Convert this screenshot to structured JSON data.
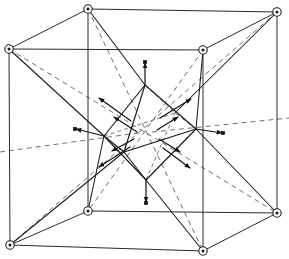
{
  "figure": {
    "caption": "",
    "width": 289,
    "height": 259,
    "background_color": "#ffffff"
  },
  "style": {
    "cube_edge_color": "#2b2b2b",
    "dashed_color": "#6f6f6f",
    "octahedron_color": "#1a1a1a",
    "arrow_color": "#111111",
    "atom_fill": "#ffffff",
    "atom_stroke": "#1a1a1a",
    "square_atom_color": "#111111"
  },
  "cube": {
    "label": "unit-cell-cube",
    "vertices": [
      {
        "id": "TLB",
        "name": "top-left-back",
        "x": 88,
        "y": 9
      },
      {
        "id": "TRB",
        "name": "top-right-back",
        "x": 277,
        "y": 12
      },
      {
        "id": "BRB",
        "name": "bottom-right-back",
        "x": 277,
        "y": 213
      },
      {
        "id": "BLB",
        "name": "bottom-left-back",
        "x": 88,
        "y": 211
      },
      {
        "id": "TLF",
        "name": "top-left-front",
        "x": 9,
        "y": 49
      },
      {
        "id": "TRF",
        "name": "top-right-front",
        "x": 203,
        "y": 50
      },
      {
        "id": "BRF",
        "name": "bottom-right-front",
        "x": 203,
        "y": 251
      },
      {
        "id": "BLF",
        "name": "bottom-left-front",
        "x": 10,
        "y": 245
      }
    ],
    "edges": [
      [
        "TLB",
        "TRB"
      ],
      [
        "TRB",
        "BRB"
      ],
      [
        "BRB",
        "BLB"
      ],
      [
        "BLB",
        "TLB"
      ],
      [
        "TLF",
        "TRF"
      ],
      [
        "TRF",
        "BRF"
      ],
      [
        "BRF",
        "BLF"
      ],
      [
        "BLF",
        "TLF"
      ],
      [
        "TLB",
        "TLF"
      ],
      [
        "TRB",
        "TRF"
      ],
      [
        "BRB",
        "BRF"
      ],
      [
        "BLB",
        "BLF"
      ]
    ],
    "corner_atom_radius": 4.2
  },
  "octahedron": {
    "label": "central-octahedron",
    "vertices": [
      {
        "id": "OT",
        "name": "octahedron-top",
        "x": 145,
        "y": 85
      },
      {
        "id": "OB",
        "name": "octahedron-bottom",
        "x": 146,
        "y": 180
      },
      {
        "id": "OL",
        "name": "octahedron-left",
        "x": 104,
        "y": 136
      },
      {
        "id": "OR",
        "name": "octahedron-right",
        "x": 196,
        "y": 129
      },
      {
        "id": "OF",
        "name": "octahedron-front",
        "x": 124,
        "y": 152
      },
      {
        "id": "OK",
        "name": "octahedron-back",
        "x": 175,
        "y": 113
      }
    ],
    "solid_edges": [
      [
        "OT",
        "OL"
      ],
      [
        "OT",
        "OR"
      ],
      [
        "OT",
        "OF"
      ],
      [
        "OB",
        "OL"
      ],
      [
        "OB",
        "OR"
      ],
      [
        "OB",
        "OF"
      ],
      [
        "OL",
        "OF"
      ],
      [
        "OR",
        "OF"
      ]
    ],
    "hidden_edges": [
      [
        "OT",
        "OK"
      ],
      [
        "OB",
        "OK"
      ],
      [
        "OL",
        "OK"
      ],
      [
        "OR",
        "OK"
      ]
    ]
  },
  "displacement_vectors": {
    "label": "atomic-displacement-arrows",
    "description": "Arrows radiating outward from the octahedron vertices and centre",
    "arrows": [
      {
        "name": "arrow-up",
        "x1": 145,
        "y1": 85,
        "x2": 145,
        "y2": 63
      },
      {
        "name": "arrow-down",
        "x1": 146,
        "y1": 180,
        "x2": 146,
        "y2": 202
      },
      {
        "name": "arrow-left",
        "x1": 104,
        "y1": 136,
        "x2": 76,
        "y2": 129
      },
      {
        "name": "arrow-right",
        "x1": 196,
        "y1": 129,
        "x2": 222,
        "y2": 133
      },
      {
        "name": "arrow-upper-left",
        "x1": 131,
        "y1": 121,
        "x2": 99,
        "y2": 98
      },
      {
        "name": "arrow-upper-right",
        "x1": 160,
        "y1": 118,
        "x2": 191,
        "y2": 99
      },
      {
        "name": "arrow-lower-left",
        "x1": 130,
        "y1": 147,
        "x2": 99,
        "y2": 167
      },
      {
        "name": "arrow-lower-right",
        "x1": 163,
        "y1": 148,
        "x2": 190,
        "y2": 168
      },
      {
        "name": "arrow-inner-left",
        "x1": 137,
        "y1": 132,
        "x2": 114,
        "y2": 117
      },
      {
        "name": "arrow-inner-right",
        "x1": 157,
        "y1": 130,
        "x2": 178,
        "y2": 117
      },
      {
        "name": "arrow-center-left",
        "x1": 134,
        "y1": 139,
        "x2": 112,
        "y2": 151
      },
      {
        "name": "arrow-center-right",
        "x1": 159,
        "y1": 139,
        "x2": 180,
        "y2": 152
      }
    ]
  },
  "bonds": {
    "label": "corner-to-octahedron-bonds",
    "lines": [
      {
        "from": "TLB",
        "to": "OT"
      },
      {
        "from": "TRB",
        "to": "OK"
      },
      {
        "from": "BLB",
        "to": "OL"
      },
      {
        "from": "BRB",
        "to": "OR"
      },
      {
        "from": "TLF",
        "to": "OL"
      },
      {
        "from": "TRF",
        "to": "OR"
      },
      {
        "from": "BLF",
        "to": "OF"
      },
      {
        "from": "BRF",
        "to": "OB"
      }
    ]
  },
  "square_atoms": {
    "label": "arrow-tip-atoms",
    "points": [
      {
        "name": "atom-top",
        "x": 145,
        "y": 62
      },
      {
        "name": "atom-bottom",
        "x": 146,
        "y": 203
      },
      {
        "name": "atom-left",
        "x": 75,
        "y": 129
      },
      {
        "name": "atom-right",
        "x": 223,
        "y": 133
      }
    ],
    "size": 3.4
  },
  "dashed_axes": {
    "label": "three-fold-and-two-fold-axes",
    "lines": [
      {
        "name": "axis-body-diagonal-nw-se",
        "x1": 88,
        "y1": 9,
        "x2": 203,
        "y2": 251
      },
      {
        "name": "axis-body-diagonal-ne-sw",
        "x1": 277,
        "y1": 12,
        "x2": 10,
        "y2": 245
      },
      {
        "name": "axis-body-diagonal-sw-ne",
        "x1": 9,
        "y1": 49,
        "x2": 277,
        "y2": 213
      },
      {
        "name": "axis-body-diagonal-se-nw",
        "x1": 203,
        "y1": 50,
        "x2": 88,
        "y2": 211
      },
      {
        "name": "axis-horizontal-left",
        "x1": 0,
        "y1": 152,
        "x2": 138,
        "y2": 133
      },
      {
        "name": "axis-horizontal-right",
        "x1": 152,
        "y1": 132,
        "x2": 289,
        "y2": 118
      }
    ]
  }
}
